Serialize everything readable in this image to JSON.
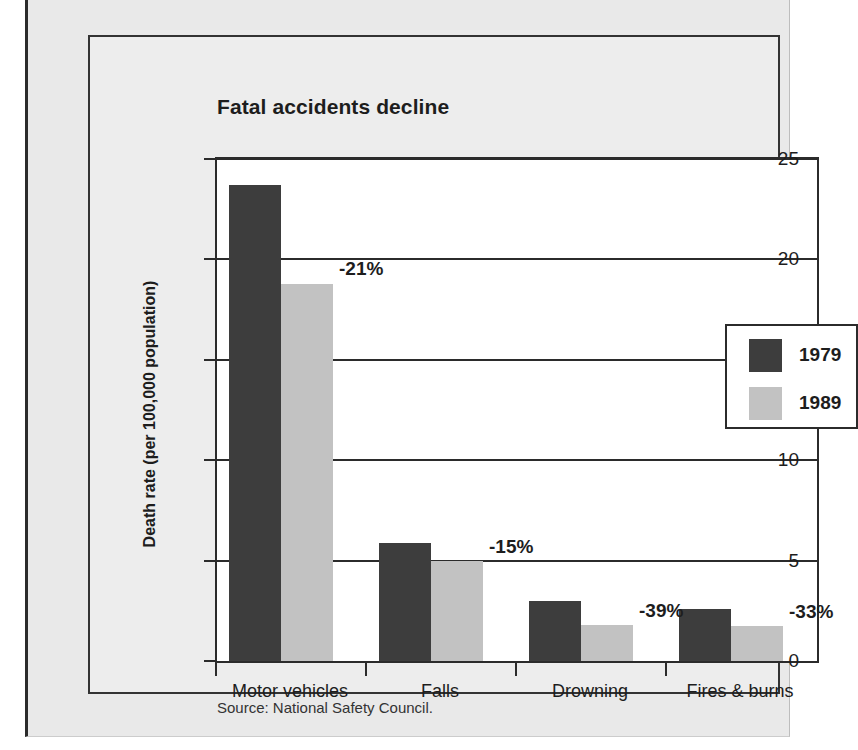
{
  "figure": {
    "title": "Fatal accidents decline",
    "source": "Source: National Safety Council."
  },
  "chart_data": {
    "type": "bar",
    "title": "Fatal accidents decline",
    "xlabel": "",
    "ylabel": "Death rate (per 100,000 population)",
    "ylim": [
      0,
      25
    ],
    "yticks": [
      0,
      5,
      10,
      15,
      20,
      25
    ],
    "ytick_labels": [
      "0",
      "5",
      "10",
      "15",
      "20",
      "25"
    ],
    "grid": true,
    "legend_position": "upper right",
    "categories": [
      "Motor vehicles",
      "Falls",
      "Drowning",
      "Fires & burns"
    ],
    "series": [
      {
        "name": "1979",
        "color": "#3d3d3d",
        "values": [
          23.7,
          5.9,
          3.0,
          2.6
        ]
      },
      {
        "name": "1989",
        "color": "#c2c2c2",
        "values": [
          18.8,
          5.0,
          1.8,
          1.75
        ]
      }
    ],
    "annotations": [
      "-21%",
      "-15%",
      "-39%",
      "-33%"
    ],
    "source": "Source: National Safety Council."
  }
}
